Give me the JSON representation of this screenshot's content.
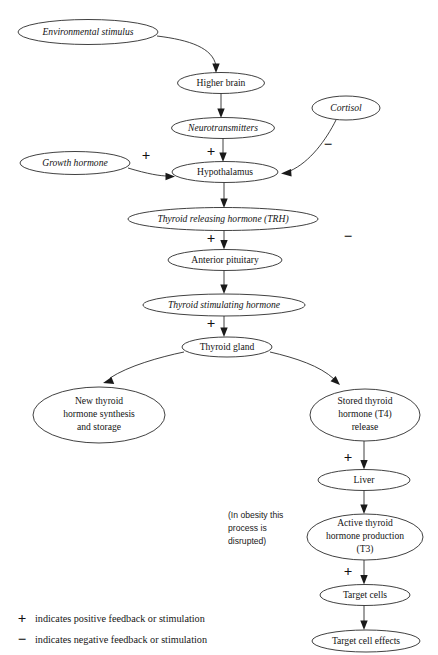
{
  "diagram": {
    "colors": {
      "stroke": "#2b2b2b",
      "text": "#141414",
      "background": "#ffffff"
    },
    "nodes": [
      {
        "id": "environmental_stimulus",
        "label": "Environmental stimulus",
        "style": "italic",
        "cx": 88,
        "cy": 32,
        "rx": 70,
        "ry": 12.5
      },
      {
        "id": "higher_brain",
        "label": "Higher brain",
        "style": "normal",
        "cx": 221,
        "cy": 83,
        "rx": 43.5,
        "ry": 10.5
      },
      {
        "id": "cortisol",
        "label": "Cortisol",
        "style": "italic",
        "cx": 346,
        "cy": 108,
        "rx": 34,
        "ry": 12
      },
      {
        "id": "neurotransmitters",
        "label": "Neurotransmitters",
        "style": "italic",
        "cx": 223,
        "cy": 128,
        "rx": 51.5,
        "ry": 10.5
      },
      {
        "id": "growth_hormone",
        "label": "Growth hormone",
        "style": "italic",
        "cx": 75,
        "cy": 163,
        "rx": 55,
        "ry": 11.5
      },
      {
        "id": "hypothalamus",
        "label": "Hypothalamus",
        "style": "normal",
        "cx": 225,
        "cy": 172,
        "rx": 53,
        "ry": 10.5
      },
      {
        "id": "trh",
        "label": "Thyroid releasing hormone (TRH)",
        "style": "italic",
        "cx": 223,
        "cy": 219,
        "rx": 95,
        "ry": 11.5
      },
      {
        "id": "anterior_pituitary",
        "label": "Anterior pituitary",
        "style": "normal",
        "cx": 225,
        "cy": 260,
        "rx": 57,
        "ry": 10.5
      },
      {
        "id": "tsh",
        "label": "Thyroid stimulating hormone",
        "style": "italic",
        "cx": 224,
        "cy": 305,
        "rx": 81,
        "ry": 11
      },
      {
        "id": "thyroid_gland",
        "label": "Thyroid gland",
        "style": "normal",
        "cx": 227,
        "cy": 347,
        "rx": 45,
        "ry": 10
      },
      {
        "id": "new_thyroid_synthesis",
        "label": "New thyroid hormone synthesis and storage",
        "style": "normal",
        "cx": 99,
        "cy": 415,
        "rx": 66,
        "ry": 28
      },
      {
        "id": "stored_t4_release",
        "label": "Stored thyroid hormone (T4) release",
        "style": "normal",
        "cx": 365,
        "cy": 415,
        "rx": 55,
        "ry": 26
      },
      {
        "id": "liver",
        "label": "Liver",
        "style": "normal",
        "cx": 364,
        "cy": 480,
        "rx": 46,
        "ry": 10.5
      },
      {
        "id": "active_t3",
        "label": "Active thyroid hormone production (T3)",
        "style": "normal",
        "cx": 365,
        "cy": 537,
        "rx": 58,
        "ry": 23
      },
      {
        "id": "target_cells",
        "label": "Target cells",
        "style": "normal",
        "cx": 365,
        "cy": 595,
        "rx": 45,
        "ry": 10.5
      },
      {
        "id": "target_cell_effects",
        "label": "Target cell effects",
        "style": "normal",
        "cx": 366,
        "cy": 641,
        "rx": 54,
        "ry": 11
      }
    ],
    "node_label_lines": {
      "environmental_stimulus": [
        "Environmental stimulus"
      ],
      "higher_brain": [
        "Higher brain"
      ],
      "cortisol": [
        "Cortisol"
      ],
      "neurotransmitters": [
        "Neurotransmitters"
      ],
      "growth_hormone": [
        "Growth hormone"
      ],
      "hypothalamus": [
        "Hypothalamus"
      ],
      "trh": [
        "Thyroid releasing hormone (TRH)"
      ],
      "anterior_pituitary": [
        "Anterior pituitary"
      ],
      "tsh": [
        "Thyroid stimulating hormone"
      ],
      "thyroid_gland": [
        "Thyroid gland"
      ],
      "new_thyroid_synthesis": [
        "New thyroid",
        "hormone synthesis",
        "and storage"
      ],
      "stored_t4_release": [
        "Stored thyroid",
        "hormone (T4)",
        "release"
      ],
      "liver": [
        "Liver"
      ],
      "active_t3": [
        "Active thyroid",
        "hormone production",
        "(T3)"
      ],
      "target_cells": [
        "Target cells"
      ],
      "target_cell_effects": [
        "Target cell effects"
      ]
    },
    "signs": [
      {
        "id": "sign-growth-hormone-to-hypothalamus",
        "symbol": "+",
        "x": 146,
        "y": 157
      },
      {
        "id": "sign-neurotransmitters-to-hypothalamus",
        "symbol": "+",
        "x": 211,
        "y": 153
      },
      {
        "id": "sign-cortisol-negative",
        "symbol": "−",
        "x": 328,
        "y": 146
      },
      {
        "id": "sign-trh-to-pituitary",
        "symbol": "+",
        "x": 211,
        "y": 240
      },
      {
        "id": "sign-feedback-negative",
        "symbol": "−",
        "x": 348,
        "y": 238
      },
      {
        "id": "sign-tsh-to-thyroid",
        "symbol": "+",
        "x": 211,
        "y": 325
      },
      {
        "id": "sign-t4-to-liver",
        "symbol": "+",
        "x": 348,
        "y": 459
      },
      {
        "id": "sign-t3-to-target-cells",
        "symbol": "+",
        "x": 348,
        "y": 573
      }
    ],
    "annotations": [
      {
        "id": "obesity-note",
        "lines": [
          "(In obesity this",
          "process is",
          "disrupted)"
        ],
        "x": 228,
        "y": 516
      }
    ],
    "legend": [
      {
        "id": "legend-positive",
        "symbol": "+",
        "text": "indicates positive feedback or stimulation"
      },
      {
        "id": "legend-negative",
        "symbol": "−",
        "text": "indicates negative feedback or stimulation"
      }
    ]
  }
}
